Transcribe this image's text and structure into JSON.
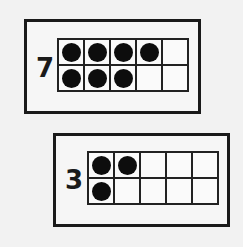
{
  "ten_frames": [
    {
      "number": "7",
      "filled": [
        1,
        1,
        1,
        1,
        0,
        1,
        1,
        1,
        0,
        0
      ]
    },
    {
      "number": "3",
      "filled": [
        1,
        1,
        0,
        0,
        0,
        1,
        0,
        0,
        0,
        0
      ]
    }
  ],
  "colors": {
    "border": "#1a1a1a",
    "dot": "#0d0d0d",
    "background": "#f2f2f2"
  }
}
